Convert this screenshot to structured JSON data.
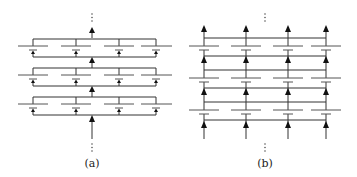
{
  "figure": {
    "panels": [
      {
        "id": "a",
        "label": "(a)",
        "description": "Series-connected groups of parallel capacitor cells; groups stacked vertically with a single current arrow between groups",
        "groups": 3,
        "cells_per_group": 4,
        "arrow_direction": "up",
        "continuation_marks": "⋮"
      },
      {
        "id": "b",
        "label": "(b)",
        "description": "Parallel columns of series-connected capacitor cells with horizontal cross-ties between columns",
        "columns": 4,
        "stages": 3,
        "arrow_direction": "up",
        "continuation_marks": "⋮"
      }
    ]
  }
}
